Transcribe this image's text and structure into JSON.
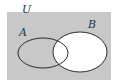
{
  "diagram": {
    "type": "venn",
    "universe_label": "U",
    "sets": [
      {
        "label": "A",
        "cx": 43,
        "cy": 53,
        "rx": 25,
        "ry": 15
      },
      {
        "label": "B",
        "cx": 80,
        "cy": 52,
        "rx": 27,
        "ry": 20
      }
    ],
    "shaded_region": "complement of B",
    "colors": {
      "shade": "#c8c8c8",
      "unshaded": "#ffffff",
      "outline": "#2a2a2a",
      "label": "#333333"
    }
  }
}
